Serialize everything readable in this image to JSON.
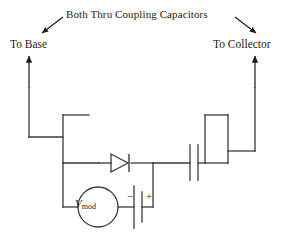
{
  "figure": {
    "kind": "circuit-schematic",
    "background_color": "#ffffff",
    "ink_color": "#1a1a1a",
    "width": 297,
    "height": 244
  },
  "annotations": {
    "title": "Both Thru Coupling Capacitors",
    "left_terminal": "To Base",
    "right_terminal": "To Collector"
  },
  "components": {
    "source": {
      "symbol": "circle-voltage-source",
      "label_main": "V",
      "label_sub": "mod"
    },
    "battery": {
      "symbol": "battery-cell",
      "minus_sign": "−",
      "plus_sign": "+"
    },
    "diode": {
      "symbol": "diode",
      "orientation": "anode-left-cathode-right"
    },
    "capacitor": {
      "symbol": "capacitor",
      "orientation": "vertical-plates"
    },
    "left_coil": {
      "symbol": "tapped-inductor-left"
    },
    "right_coil": {
      "symbol": "tapped-inductor-right"
    }
  },
  "arrows": {
    "title_to_base_arrow": "pointer-down-left",
    "title_to_collector_arrow": "pointer-down-right",
    "base_up_arrow": "pointer-up",
    "collector_up_arrow": "pointer-up"
  },
  "colors": {
    "ink": "#1a1a1a",
    "wire": "#3a3a3a",
    "paper": "#ffffff"
  }
}
